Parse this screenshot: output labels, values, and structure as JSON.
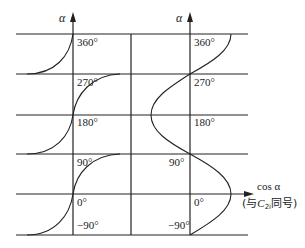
{
  "diagram": {
    "left_panel": {
      "axis_label": "α",
      "tick_labels": [
        "360°",
        "270°",
        "180°",
        "90°",
        "0°",
        "−90°"
      ],
      "curve": "periodic S-curve (flat at ±90° boundaries, vertical at 0°, 180°, 360°)"
    },
    "right_panel": {
      "axis_label": "α",
      "tick_labels": [
        "360°",
        "270°",
        "180°",
        "90°",
        "0°",
        "−90°"
      ],
      "x_axis_label": "cos α",
      "x_axis_note_prefix": "(与",
      "x_axis_note_var": "C",
      "x_axis_note_sub": "2i",
      "x_axis_note_suffix": "同号)",
      "curve": "cos α plotted horizontally vs α vertically"
    },
    "colors": {
      "line": "#222222",
      "background": "#ffffff"
    }
  }
}
